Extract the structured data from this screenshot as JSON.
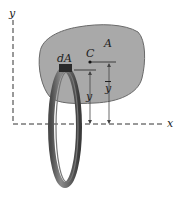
{
  "diagram": {
    "type": "area-moment-diagram",
    "axes": {
      "x_label": "x",
      "y_label": "y"
    },
    "region": {
      "label": "A",
      "fill_color": "#a9a9a9",
      "edge_color": "#555555"
    },
    "centroid": {
      "label": "C"
    },
    "element": {
      "label": "dA",
      "ring_color": "#5a5a5a"
    },
    "dimensions": {
      "element_distance": "y",
      "centroid_distance": "y",
      "centroid_overbar": true
    }
  }
}
